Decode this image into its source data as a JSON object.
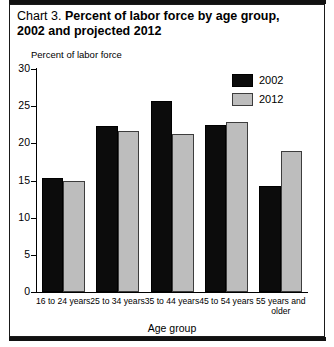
{
  "title": {
    "prefix": "Chart 3.",
    "line1": "Percent of labor force by age group,",
    "line2": "2002 and projected 2012"
  },
  "legend": {
    "position": "upper-right",
    "entries": [
      {
        "label": "2002",
        "color": "#0c0c0c",
        "icon": "legend-swatch-icon"
      },
      {
        "label": "2012",
        "color": "#bdbdbd",
        "icon": "legend-swatch-icon"
      }
    ]
  },
  "axes": {
    "ylabel": "Percent of labor force",
    "xlabel": "Age group",
    "yticks": [
      "0",
      "5",
      "10",
      "15",
      "20",
      "25",
      "30"
    ]
  },
  "chart_data": {
    "type": "bar",
    "title": "Chart 3. Percent of labor force by age group, 2002 and projected 2012",
    "xlabel": "Age group",
    "ylabel": "Percent of labor force",
    "categories": [
      "16 to 24 years",
      "25 to 34 years",
      "35 to 44 years",
      "45 to 54 years",
      "55 years and older"
    ],
    "series": [
      {
        "name": "2002",
        "color": "#0c0c0c",
        "values": [
          15.4,
          22.3,
          25.7,
          22.5,
          14.2
        ]
      },
      {
        "name": "2012",
        "color": "#bdbdbd",
        "values": [
          15.0,
          21.7,
          21.3,
          22.9,
          19.0
        ]
      }
    ],
    "ylim": [
      0,
      30
    ],
    "ytick_step": 5,
    "grid": false,
    "legend_position": "upper right"
  }
}
